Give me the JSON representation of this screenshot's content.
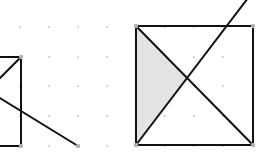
{
  "canvas": {
    "width": 256,
    "height": 155,
    "background": "#ffffff"
  },
  "colors": {
    "stroke": "#111111",
    "grid_dot": "#c8c8c8",
    "vertex_dot": "#b0b0b0",
    "shade": "#e3e3e3"
  },
  "grid": {
    "xs": [
      20,
      49,
      78,
      107,
      165,
      194,
      223
    ],
    "ys": [
      27,
      57,
      86,
      116,
      146
    ]
  },
  "figures": [
    {
      "name": "left-square-partial",
      "square": {
        "x1": -70,
        "y1": 57,
        "x2": 21,
        "y2": 146
      },
      "segments": [
        {
          "x1": 21,
          "y1": 57,
          "x2": -10,
          "y2": 88
        },
        {
          "x1": -10,
          "y1": 92,
          "x2": 78,
          "y2": 146
        }
      ],
      "vertices": [
        {
          "x": 21,
          "y": 57
        },
        {
          "x": 21,
          "y": 146
        },
        {
          "x": 78,
          "y": 146
        }
      ]
    },
    {
      "name": "right-square",
      "square": {
        "x1": 136,
        "y1": 26,
        "x2": 253,
        "y2": 145
      },
      "segments": [
        {
          "x1": 136,
          "y1": 26,
          "x2": 253,
          "y2": 145
        },
        {
          "x1": 136,
          "y1": 145,
          "x2": 248,
          "y2": -2
        }
      ],
      "shaded_triangle": [
        {
          "x": 136,
          "y": 26
        },
        {
          "x": 188,
          "y": 79
        },
        {
          "x": 136,
          "y": 145
        }
      ],
      "vertices": [
        {
          "x": 136,
          "y": 26
        },
        {
          "x": 253,
          "y": 26
        },
        {
          "x": 136,
          "y": 145
        },
        {
          "x": 253,
          "y": 145
        }
      ]
    }
  ]
}
